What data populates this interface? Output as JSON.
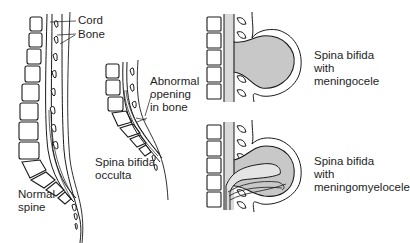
{
  "diagram": {
    "panels": [
      {
        "id": "normal",
        "label": "Normal\nspine"
      },
      {
        "id": "occulta",
        "label": "Spina bifida\nocculta"
      },
      {
        "id": "meningocele",
        "label": "Spina bifida\nwith\nmeningocele"
      },
      {
        "id": "meningomyelocele",
        "label": "Spina bifida\nwith\nmeningomyelocele"
      }
    ],
    "annotations": {
      "cord": "Cord",
      "bone": "Bone",
      "abnormal_opening": "Abnormal\nopening\nin bone"
    },
    "colors": {
      "line": "#1a1a1a",
      "fill_gray": "#c8c8c8",
      "cord_gray": "#d9d9d9",
      "background": "#ffffff"
    }
  }
}
